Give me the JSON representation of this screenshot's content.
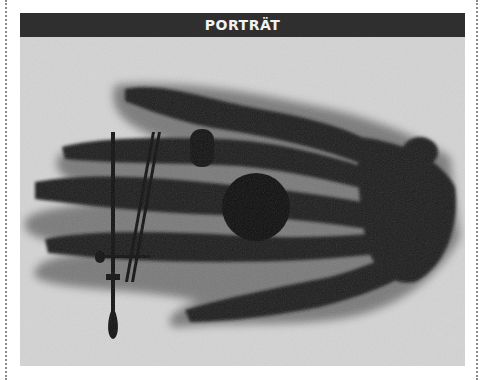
{
  "header": {
    "title": "PORTRÄT"
  },
  "photo": {
    "subject": "x-ray-of-hand-with-ring",
    "colors": {
      "background": "#d6d6d6",
      "bone": "#1a1a1a",
      "flesh": "#5a5a5a",
      "header_bg": "#2f2f2f",
      "header_text": "#f2f2f2"
    }
  }
}
